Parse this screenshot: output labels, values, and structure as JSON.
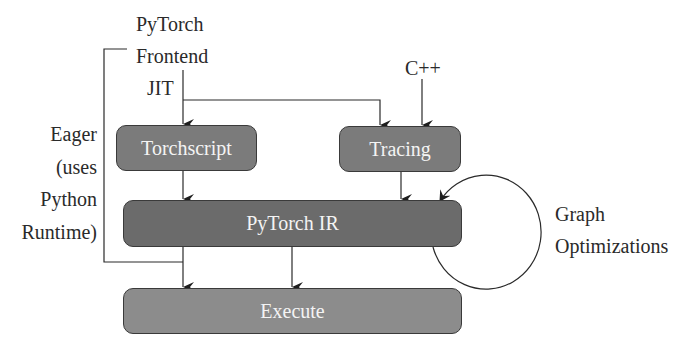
{
  "labels": {
    "pytorch": "PyTorch",
    "frontend": "Frontend",
    "jit": "JIT",
    "cpp": "C++",
    "eager": [
      "Eager",
      "(uses",
      "Python",
      "Runtime)"
    ],
    "graph_opt": [
      "Graph",
      "Optimizations"
    ]
  },
  "boxes": {
    "torchscript": "Torchscript",
    "tracing": "Tracing",
    "ir": "PyTorch IR",
    "execute": "Execute"
  },
  "colors": {
    "box_mid": "#7b7b7b",
    "box_dark": "#6b6b6b",
    "box_light": "#8c8c8c",
    "line": "#2a2a2a",
    "box_text": "#f4f4f4"
  }
}
